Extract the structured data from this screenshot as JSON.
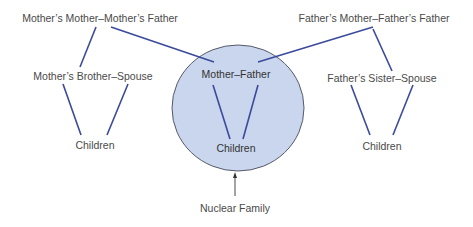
{
  "diagram": {
    "colors": {
      "line": "#3b4a9a",
      "circle_fill": "#c9d6ee",
      "circle_stroke": "#555a6a",
      "text": "#4a4a4a",
      "arrow": "#333333"
    },
    "nodes": {
      "maternal_grandparents": "Mother’s Mother–Mother’s Father",
      "paternal_grandparents": "Father’s Mother–Father’s Father",
      "maternal_uncle": "Mother’s Brother–Spouse",
      "paternal_aunt": "Father’s Sister–Spouse",
      "parents": "Mother–Father",
      "left_children": "Children",
      "center_children": "Children",
      "right_children": "Children"
    },
    "annotation": "Nuclear Family"
  }
}
